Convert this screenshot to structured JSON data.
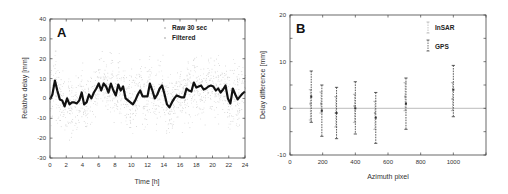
{
  "chart_data": [
    {
      "panel": "A",
      "type": "line",
      "xlabel": "Time [h]",
      "ylabel": "Relative delay [mm]",
      "xlim": [
        0,
        24
      ],
      "ylim": [
        -30,
        40
      ],
      "xticks": [
        0,
        2,
        4,
        6,
        8,
        10,
        12,
        14,
        16,
        18,
        20,
        22,
        24
      ],
      "yticks": [
        -30,
        -20,
        -10,
        0,
        10,
        20,
        30,
        40
      ],
      "legend": [
        "Raw 30 sec",
        "Filtered"
      ],
      "legend_position": "upper right",
      "grid": false,
      "series": [
        {
          "name": "Filtered",
          "style": "thick black line",
          "x": [
            0,
            0.3,
            0.6,
            0.9,
            1.2,
            1.5,
            1.8,
            2.1,
            2.4,
            2.7,
            3.0,
            3.3,
            3.6,
            3.9,
            4.2,
            4.5,
            4.8,
            5.1,
            5.4,
            5.7,
            6.0,
            6.3,
            6.6,
            6.9,
            7.2,
            7.5,
            7.8,
            8.1,
            8.4,
            8.7,
            9.0,
            9.3,
            9.6,
            9.9,
            10.2,
            10.5,
            10.8,
            11.1,
            11.4,
            11.7,
            12.0,
            12.3,
            12.6,
            12.9,
            13.2,
            13.5,
            13.8,
            14.1,
            14.4,
            14.7,
            15.0,
            15.3,
            15.6,
            15.9,
            16.2,
            16.5,
            16.8,
            17.1,
            17.4,
            17.7,
            18.0,
            18.3,
            18.6,
            18.9,
            19.2,
            19.5,
            19.8,
            20.1,
            20.4,
            20.7,
            21.0,
            21.3,
            21.6,
            21.9,
            22.2,
            22.5,
            22.8,
            23.1,
            23.4,
            23.7,
            24.0
          ],
          "y": [
            -0.5,
            2,
            9,
            4,
            -0.5,
            -1,
            -4,
            0,
            -3,
            -2,
            -2,
            -2.5,
            -1,
            3,
            -3,
            -2,
            2,
            0,
            3,
            5,
            7.5,
            4,
            7.5,
            6,
            3,
            7.5,
            4,
            1.5,
            7,
            4,
            6,
            0,
            -1,
            -2,
            -3,
            -1,
            2,
            4,
            1,
            1,
            1,
            7.5,
            4,
            0,
            2,
            5,
            6.5,
            2,
            -3,
            -4.5,
            -2,
            0,
            1.5,
            1,
            0.5,
            0.5,
            5,
            4,
            3.5,
            8,
            5.5,
            6,
            6.5,
            4.5,
            5,
            6,
            6.5,
            6,
            4,
            5,
            3,
            4.5,
            6.5,
            0,
            -2.5,
            5,
            2,
            -0.5,
            1,
            2.5,
            3.5
          ]
        },
        {
          "name": "Raw 30 sec",
          "style": "light gray scattered dots",
          "note": "dense noisy samples, mostly within about -15 to +20 mm around the filtered curve"
        }
      ]
    },
    {
      "panel": "B",
      "type": "scatter",
      "xlabel": "Azimuth pixel",
      "ylabel": "Delay difference [mm]",
      "xlim": [
        0,
        1200
      ],
      "ylim": [
        -10,
        20
      ],
      "xticks": [
        0,
        200,
        400,
        600,
        800,
        1000
      ],
      "yticks": [
        -10,
        0,
        10,
        20
      ],
      "legend": [
        "InSAR",
        "GPS"
      ],
      "legend_position": "upper right",
      "reference_line": 0,
      "grid": false,
      "series": [
        {
          "name": "GPS",
          "style": "dark dashed error bars",
          "x": [
            130,
            195,
            285,
            400,
            525,
            710,
            1000
          ],
          "y": [
            2.5,
            -0.5,
            -1,
            0,
            -2,
            1,
            4
          ],
          "err_low": [
            -3,
            -6,
            -6.5,
            -5.5,
            -7.5,
            -4.5,
            -1.8
          ],
          "err_high": [
            8,
            5,
            4.5,
            5.7,
            3.4,
            6.5,
            9.2
          ]
        },
        {
          "name": "InSAR",
          "style": "light gray dashed error bars",
          "x": [
            125,
            190,
            280,
            395,
            520,
            705,
            995
          ],
          "y": [
            1,
            1,
            -1,
            0.5,
            -1,
            2.5,
            2
          ],
          "err_low": [
            -2.5,
            -1,
            -4,
            -3,
            -4.5,
            -0.5,
            -0.5
          ],
          "err_high": [
            4,
            3.5,
            2.5,
            3,
            1.5,
            5.5,
            5.5
          ]
        }
      ]
    }
  ],
  "panels": {
    "a": {
      "label": "A",
      "xlabel": "Time [h]",
      "ylabel": "Relative delay [mm]",
      "legend_raw": "Raw 30 sec",
      "legend_filtered": "Filtered"
    },
    "b": {
      "label": "B",
      "xlabel": "Azimuth pixel",
      "ylabel": "Delay difference [mm]",
      "legend_insar": "InSAR",
      "legend_gps": "GPS"
    }
  }
}
